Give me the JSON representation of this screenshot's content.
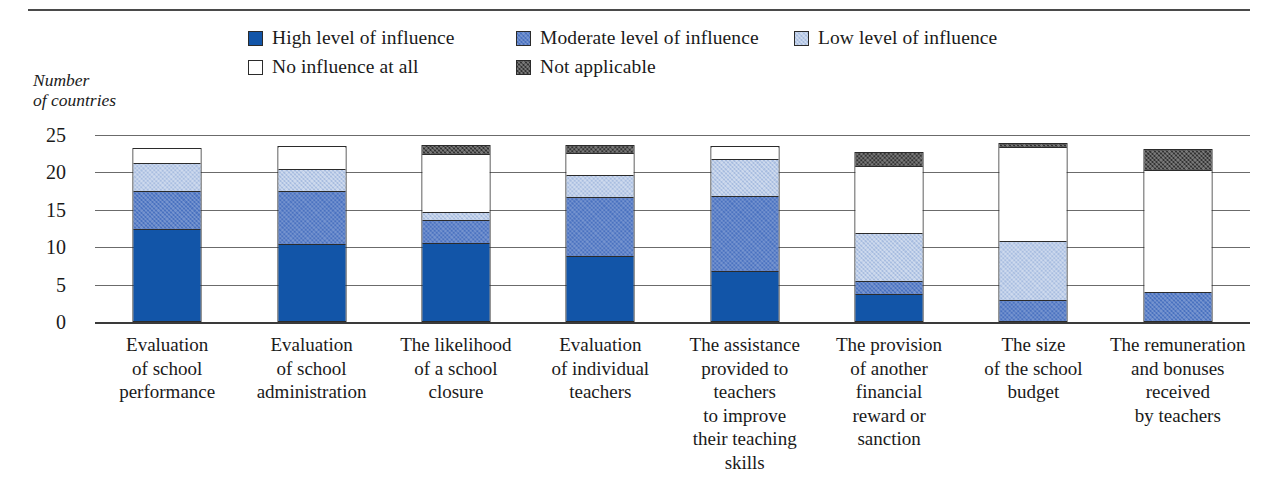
{
  "axis_title": "Number\nof countries",
  "legend": {
    "rows": [
      [
        {
          "label": "High level of influence",
          "key": "high",
          "color": "#1255a8"
        },
        {
          "label": "Moderate level of influence",
          "key": "moderate",
          "color": "#4a72c0"
        },
        {
          "label": "Low level of influence",
          "key": "low",
          "color": "#a8bde0"
        }
      ],
      [
        {
          "label": "No influence at all",
          "key": "none",
          "color": "#ffffff"
        },
        {
          "label": "Not applicable",
          "key": "na",
          "color": "#333333"
        }
      ]
    ]
  },
  "chart_data": {
    "type": "bar",
    "subtype": "stacked-vertical",
    "title": "",
    "xlabel": "",
    "ylabel": "Number of countries",
    "ylim": [
      0,
      25
    ],
    "yticks": [
      25,
      20,
      15,
      10,
      5,
      0
    ],
    "ytick_labels": [
      "25",
      "20",
      "15",
      "10",
      "5",
      "0"
    ],
    "grid": true,
    "legend_position": "top",
    "categories": [
      "Evaluation\nof school\nperformance",
      "Evaluation\nof school\nadministration",
      "The likelihood\nof a school\nclosure",
      "Evaluation\nof individual\nteachers",
      "The assistance\nprovided to\nteachers\nto improve\ntheir teaching\nskills",
      "The provision\nof another\nfinancial\nreward or\nsanction",
      "The size\nof the school\nbudget",
      "The remuneration\nand bonuses\nreceived\nby teachers"
    ],
    "series": [
      {
        "name": "High level of influence",
        "key": "high",
        "color": "#1255a8",
        "values": [
          12.2,
          10.2,
          10.3,
          8.5,
          6.5,
          3.5,
          0.0,
          0.0
        ]
      },
      {
        "name": "Moderate level of influence",
        "key": "moderate",
        "color": "#4a72c0",
        "values": [
          5.0,
          7.1,
          3.1,
          7.9,
          10.1,
          1.7,
          2.7,
          3.7
        ]
      },
      {
        "name": "Low level of influence",
        "key": "low",
        "color": "#a8bde0",
        "values": [
          3.8,
          2.9,
          1.0,
          3.0,
          4.9,
          6.4,
          7.9,
          0.0
        ]
      },
      {
        "name": "No influence at all",
        "key": "none",
        "color": "#ffffff",
        "values": [
          2.0,
          3.0,
          7.8,
          2.9,
          1.7,
          9.0,
          12.6,
          16.3
        ]
      },
      {
        "name": "Not applicable",
        "key": "na",
        "color": "#333333",
        "values": [
          0.0,
          0.0,
          1.2,
          1.1,
          0.0,
          1.9,
          0.5,
          2.8
        ]
      }
    ],
    "totals": [
      23.0,
      23.2,
      23.4,
      23.4,
      23.2,
      22.5,
      23.7,
      22.8
    ]
  }
}
